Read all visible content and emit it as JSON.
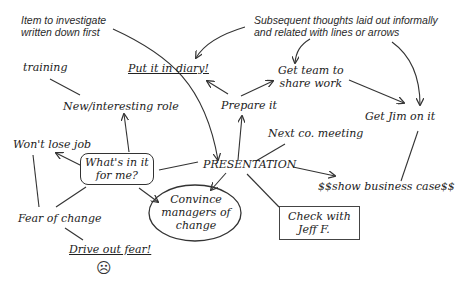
{
  "annotations": {
    "first_item": [
      "Item to investigate",
      "written down first"
    ],
    "subsequent": [
      "Subsequent thoughts laid out informally",
      "and related with lines or arrows"
    ]
  },
  "nodes": {
    "center": "PRESENTATION",
    "training": "training",
    "diary": "Put it in diary!",
    "new_role": "New/interesting role",
    "prepare": "Prepare it",
    "get_team": [
      "Get team to",
      "share work"
    ],
    "get_jim": "Get Jim on it",
    "next_meeting": "Next co. meeting",
    "wont_lose_job": "Won't lose job",
    "whats_in_it": [
      "What's in it",
      "for me?"
    ],
    "business_case": "$$show business case$$",
    "convince": [
      "Convince",
      "managers of",
      "change"
    ],
    "check_jeff": [
      "Check with",
      "Jeff F."
    ],
    "fear": "Fear of change",
    "drive_out": "Drive out fear!",
    "sad_face": "☹"
  },
  "colors": {
    "ink": "#2a2a2a",
    "background": "#ffffff"
  }
}
